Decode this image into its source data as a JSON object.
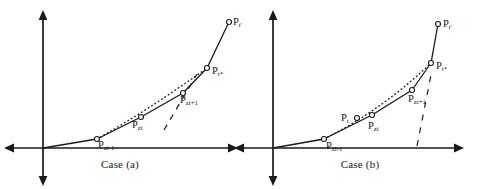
{
  "figure": {
    "background": "#ffffff",
    "stroke_color": "#1a1a1a",
    "panels": [
      {
        "id": "case-a",
        "caption": "Case (a)",
        "axes": {
          "origin_x": 43,
          "origin_y": 148,
          "vertical_top": 12,
          "vertical_bottom": 182,
          "horizontal_left": 4,
          "horizontal_right": 236,
          "arrowheads": "both-ends-both-axes"
        },
        "solid_polyline": [
          [
            43,
            148
          ],
          [
            97,
            139
          ],
          [
            141,
            117
          ],
          [
            183,
            93
          ],
          [
            207,
            68
          ],
          [
            229,
            22
          ]
        ],
        "dotted_arc": [
          [
            97,
            139
          ],
          [
            120,
            127
          ],
          [
            145,
            111
          ],
          [
            170,
            95
          ],
          [
            192,
            80
          ],
          [
            207,
            68
          ]
        ],
        "dashed_line": [
          [
            166,
            126
          ],
          [
            196,
            76
          ]
        ],
        "markers": [
          {
            "name": "p-zi-minus-1",
            "x": 97,
            "y": 139,
            "base": "P",
            "sub": "zi-1"
          },
          {
            "name": "p-zi",
            "x": 141,
            "y": 117,
            "base": "P",
            "sub": "zi"
          },
          {
            "name": "p-zi-plus-1",
            "x": 183,
            "y": 93,
            "base": "P",
            "sub": "zi+1"
          },
          {
            "name": "p-t-star",
            "x": 207,
            "y": 68,
            "base": "P",
            "sub": "t*"
          },
          {
            "name": "p-t-prime",
            "x": 229,
            "y": 22,
            "base": "P",
            "sub": "t'"
          }
        ],
        "labels": [
          {
            "name": "label-p-zi-minus-1",
            "base": "P",
            "sub": "zi-1",
            "x": 98,
            "y": 140
          },
          {
            "name": "label-p-zi",
            "base": "P",
            "sub": "zi",
            "x": 132,
            "y": 120
          },
          {
            "name": "label-p-zi-plus-1",
            "base": "P",
            "sub": "zi+1",
            "x": 180,
            "y": 95
          },
          {
            "name": "label-p-t-star",
            "base": "P",
            "sub": "t*",
            "x": 212,
            "y": 66
          },
          {
            "name": "label-p-t-prime",
            "base": "P",
            "sub": "t'",
            "x": 233,
            "y": 17
          }
        ]
      },
      {
        "id": "case-b",
        "caption": "Case (b)",
        "axes": {
          "origin_x": 33,
          "origin_y": 148,
          "vertical_top": 12,
          "vertical_bottom": 182,
          "horizontal_left": -4,
          "horizontal_right": 222,
          "arrowheads": "both-ends-both-axes"
        },
        "solid_polyline": [
          [
            33,
            148
          ],
          [
            84,
            139
          ],
          [
            132,
            115
          ],
          [
            172,
            90
          ],
          [
            191,
            63
          ],
          [
            198,
            24
          ]
        ],
        "dotted_arc": [
          [
            84,
            139
          ],
          [
            105,
            128
          ],
          [
            128,
            116
          ],
          [
            152,
            102
          ],
          [
            175,
            84
          ],
          [
            191,
            63
          ]
        ],
        "dashed_line": [
          [
            178,
            142
          ],
          [
            192,
            72
          ]
        ],
        "markers": [
          {
            "name": "p-zi-minus-1",
            "x": 84,
            "y": 139,
            "base": "P",
            "sub": "zi-1"
          },
          {
            "name": "p-t",
            "x": 117,
            "y": 118,
            "base": "P",
            "sub": "t"
          },
          {
            "name": "p-zi",
            "x": 132,
            "y": 115,
            "base": "P",
            "sub": "zi"
          },
          {
            "name": "p-zi-plus-1",
            "x": 172,
            "y": 90,
            "base": "P",
            "sub": "zi+1"
          },
          {
            "name": "p-t-star",
            "x": 191,
            "y": 63,
            "base": "P",
            "sub": "t*"
          },
          {
            "name": "p-t-prime",
            "x": 198,
            "y": 24,
            "base": "P",
            "sub": "t'"
          }
        ],
        "labels": [
          {
            "name": "label-p-zi-minus-1",
            "base": "P",
            "sub": "zi-1",
            "x": 86,
            "y": 141
          },
          {
            "name": "label-p-t",
            "base": "P",
            "sub": "t",
            "x": 101,
            "y": 113
          },
          {
            "name": "label-p-zi",
            "base": "P",
            "sub": "zi",
            "x": 128,
            "y": 121
          },
          {
            "name": "label-p-zi-plus-1",
            "base": "P",
            "sub": "zi+1",
            "x": 168,
            "y": 94
          },
          {
            "name": "label-p-t-star",
            "base": "P",
            "sub": "t*",
            "x": 196,
            "y": 61
          },
          {
            "name": "label-p-t-prime",
            "base": "P",
            "sub": "t'",
            "x": 203,
            "y": 19
          }
        ]
      }
    ]
  }
}
